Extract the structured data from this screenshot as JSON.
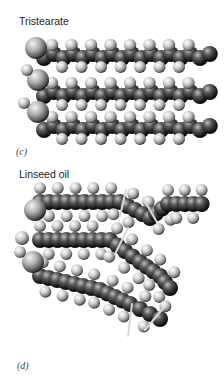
{
  "figure": {
    "panels": [
      {
        "tag": "(c)",
        "title": "Tristearate",
        "description": "Space-filling model of tristearate: three straight saturated fatty acid chains packed in parallel",
        "chains": [
          {
            "y": 48,
            "x_start": 36,
            "x_end": 212
          },
          {
            "y": 86,
            "x_start": 36,
            "x_end": 212
          },
          {
            "y": 120,
            "x_start": 36,
            "x_end": 212
          }
        ],
        "glycerol_atoms": [
          {
            "x": 36,
            "y": 48,
            "r": 11
          },
          {
            "x": 38,
            "y": 80,
            "r": 11
          },
          {
            "x": 38,
            "y": 112,
            "r": 11
          },
          {
            "x": 27,
            "y": 70,
            "r": 6
          },
          {
            "x": 24,
            "y": 103,
            "r": 6
          }
        ]
      },
      {
        "tag": "(d)",
        "title": "Linseed oil",
        "description": "Space-filling model of linseed oil: three unsaturated chains with cis double bonds producing kinks",
        "chains": [
          {
            "points": [
              [
                40,
                198
              ],
              [
                120,
                198
              ],
              [
                150,
                214
              ],
              [
                168,
                200
              ],
              [
                210,
                200
              ]
            ]
          },
          {
            "points": [
              [
                40,
                236
              ],
              [
                110,
                236
              ],
              [
                140,
                258
              ],
              [
                160,
                272
              ],
              [
                175,
                290
              ]
            ]
          },
          {
            "points": [
              [
                40,
                272
              ],
              [
                100,
                286
              ],
              [
                130,
                300
              ],
              [
                150,
                310
              ],
              [
                170,
                320
              ]
            ]
          }
        ],
        "double_bonds": [
          {
            "x1": 126,
            "y1": 190,
            "x2": 120,
            "y2": 216
          },
          {
            "x1": 143,
            "y1": 198,
            "x2": 158,
            "y2": 224
          },
          {
            "x1": 128,
            "y1": 228,
            "x2": 115,
            "y2": 254
          },
          {
            "x1": 132,
            "y1": 304,
            "x2": 128,
            "y2": 336
          },
          {
            "x1": 165,
            "y1": 306,
            "x2": 145,
            "y2": 330
          }
        ],
        "glycerol_atoms": [
          {
            "x": 35,
            "y": 210,
            "r": 11
          },
          {
            "x": 33,
            "y": 262,
            "r": 11
          },
          {
            "x": 22,
            "y": 238,
            "r": 7
          },
          {
            "x": 20,
            "y": 252,
            "r": 6
          }
        ]
      }
    ],
    "colors": {
      "atom_light": "#e8e8e8",
      "atom_mid": "#9a9a9a",
      "atom_dark": "#1c1c1c",
      "bond_highlight": "#d8d8d8"
    }
  }
}
